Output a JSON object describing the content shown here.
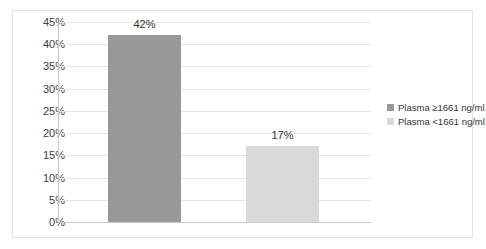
{
  "chart_data": {
    "type": "bar",
    "title": "",
    "subtitle": "",
    "xlabel": "",
    "ylabel": "",
    "categories": [
      "Plasma ≥1661 ng/ml",
      "Plasma <1661 ng/ml"
    ],
    "values": [
      42,
      17
    ],
    "data_labels": [
      "42%",
      "17%"
    ],
    "ylim": [
      0,
      45
    ],
    "ytick_values": [
      0,
      5,
      10,
      15,
      20,
      25,
      30,
      35,
      40,
      45
    ],
    "ytick_labels": [
      "0%",
      "5%",
      "10%",
      "15%",
      "20%",
      "25%",
      "30%",
      "35%",
      "40%",
      "45%"
    ],
    "grid": true,
    "legend_position": "right",
    "series": [
      {
        "name": "Plasma ≥1661 ng/ml",
        "value": 42,
        "label": "42%",
        "color": "#989898"
      },
      {
        "name": "Plasma <1661 ng/ml",
        "value": 17,
        "label": "17%",
        "color": "#d9d9d9"
      }
    ]
  },
  "legend": {
    "items": [
      {
        "label": "Plasma ≥1661 ng/ml",
        "color": "#989898"
      },
      {
        "label": "Plasma <1661 ng/ml",
        "color": "#d9d9d9"
      }
    ]
  },
  "colors": {
    "series_dark": "#989898",
    "series_light": "#d9d9d9",
    "gridline": "#e4e4e4",
    "axis": "#c8c8c8",
    "frame_border": "#e2e2e2",
    "text": "#404040",
    "background": "#ffffff"
  }
}
